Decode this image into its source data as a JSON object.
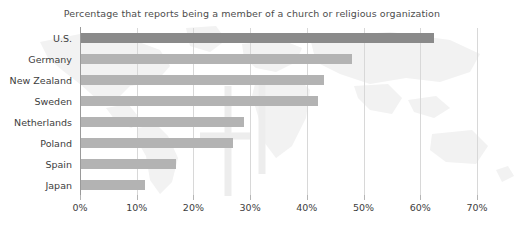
{
  "chart_data": {
    "type": "bar",
    "orientation": "horizontal",
    "title": "Percentage that reports being a member of a church or religious organization",
    "xlabel": "",
    "ylabel": "",
    "categories": [
      "U.S.",
      "Germany",
      "New Zealand",
      "Sweden",
      "Netherlands",
      "Poland",
      "Spain",
      "Japan"
    ],
    "values": [
      62.5,
      48,
      43,
      42,
      29,
      27,
      17,
      11.5
    ],
    "xlim": [
      0,
      70
    ],
    "xticks": [
      0,
      10,
      20,
      30,
      40,
      50,
      60,
      70
    ],
    "xtick_labels": [
      "0%",
      "10%",
      "20%",
      "30%",
      "40%",
      "50%",
      "60%",
      "70%"
    ],
    "grid": "vertical",
    "legend": "none",
    "highlight_category": "U.S.",
    "colors": {
      "bar": "#b3b3b3",
      "bar_highlight": "#8a8a8a",
      "gridline": "#d8d8d8",
      "axis": "#9a9a9a",
      "text": "#3d3d3d",
      "title_text": "#4d4d4d",
      "background": "#ffffff",
      "watermark": "#f0f0f0"
    },
    "background_graphic": "world-map-watermark"
  }
}
